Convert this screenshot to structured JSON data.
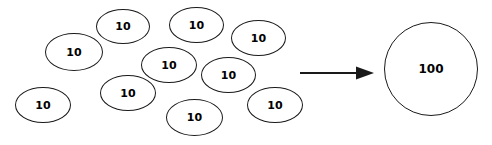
{
  "diagram": {
    "background_color": "#ffffff",
    "stroke_color": "#1a1a1a",
    "text_color": "#000000",
    "left_group": {
      "label": "group-of-ten-tens",
      "count": 10,
      "unit_value": "10",
      "items": [
        {
          "value": "10",
          "x": 45,
          "y": 33,
          "w": 58,
          "h": 38
        },
        {
          "value": "10",
          "x": 96,
          "y": 9,
          "w": 54,
          "h": 35
        },
        {
          "value": "10",
          "x": 169,
          "y": 7,
          "w": 55,
          "h": 36
        },
        {
          "value": "10",
          "x": 231,
          "y": 20,
          "w": 55,
          "h": 36
        },
        {
          "value": "10",
          "x": 141,
          "y": 47,
          "w": 56,
          "h": 36
        },
        {
          "value": "10",
          "x": 201,
          "y": 57,
          "w": 55,
          "h": 36
        },
        {
          "value": "10",
          "x": 100,
          "y": 75,
          "w": 56,
          "h": 36
        },
        {
          "value": "10",
          "x": 15,
          "y": 87,
          "w": 56,
          "h": 36
        },
        {
          "value": "10",
          "x": 166,
          "y": 99,
          "w": 57,
          "h": 37
        },
        {
          "value": "10",
          "x": 247,
          "y": 87,
          "w": 56,
          "h": 36
        }
      ]
    },
    "arrow": {
      "label": "equals-arrow",
      "direction": "right"
    },
    "right_group": {
      "label": "one-hundred",
      "value": "100",
      "x": 384,
      "y": 22,
      "w": 94,
      "h": 94
    }
  }
}
